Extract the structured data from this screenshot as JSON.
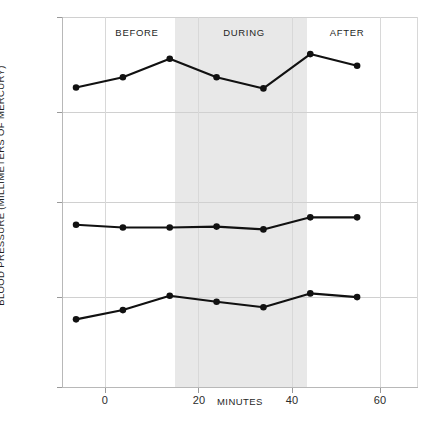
{
  "chart_data": {
    "type": "line",
    "title": "",
    "xlabel": "MINUTES",
    "ylabel": "BLOOD PRESSURE (MILLIMETERS OF MERCURY)",
    "x": [
      0,
      10,
      20,
      30,
      40,
      50,
      60
    ],
    "xlim": [
      -3,
      73
    ],
    "ylim": [
      40,
      120
    ],
    "xticks": [
      0,
      20,
      40,
      60
    ],
    "xtick_labels": [
      "0",
      "20",
      "40",
      "60"
    ],
    "yticks": [
      40,
      60,
      80,
      100,
      120
    ],
    "ytick_labels": [
      "40",
      "60",
      "80",
      "100",
      "120"
    ],
    "grid": true,
    "legend": "none",
    "line_color": "#111111",
    "marker_color": "#111111",
    "band_color": "#e8e8e8",
    "grid_color": "#d0d0d0",
    "series": [
      {
        "name": "systolic",
        "values": [
          104.8,
          107.0,
          111.0,
          107.0,
          104.6,
          112.0,
          109.5
        ]
      },
      {
        "name": "mean arterial",
        "values": [
          75.2,
          74.6,
          74.6,
          74.8,
          74.2,
          76.8,
          76.8
        ]
      },
      {
        "name": "diastolic",
        "values": [
          54.8,
          56.8,
          59.9,
          58.6,
          57.4,
          60.4,
          59.6
        ]
      }
    ],
    "annotations": [
      {
        "text": "BEFORE",
        "x_minutes": 7.5,
        "y_value": 117.0
      },
      {
        "text": "DURING",
        "x_minutes": 30.0,
        "y_value": 117.0
      },
      {
        "text": "AFTER",
        "x_minutes": 52.0,
        "y_value": 117.0
      }
    ],
    "shaded_bands": [
      {
        "label": "DURING",
        "x_start_minutes": 15.0,
        "x_end_minutes": 44.5,
        "color": "#e8e8e8"
      }
    ]
  },
  "caption": ""
}
